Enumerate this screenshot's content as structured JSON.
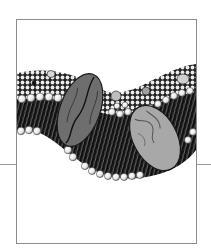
{
  "figure": {
    "style": "black-and-white engraving illustration",
    "frame": {
      "x": 16,
      "y": 19,
      "width": 181,
      "height": 225,
      "color": "#8c8c8c"
    },
    "rule": {
      "y": 164,
      "color": "#9a9a9a",
      "left": {
        "x1": 0,
        "x2": 16
      },
      "right": {
        "x1": 196,
        "x2": 211
      }
    },
    "colors": {
      "background": "#ffffff",
      "tails": "#111111",
      "head_fill": "#f4f4f4",
      "head_stroke": "#222222",
      "protein_left": "#6e6e6e",
      "protein_right": "#a8a8a8",
      "protein_outline": "#1a1a1a"
    },
    "proteins": [
      {
        "name": "left-protein",
        "cx": 80,
        "cy": 110,
        "rx": 20,
        "ry": 38,
        "rotate": 20
      },
      {
        "name": "right-protein",
        "cx": 155,
        "cy": 138,
        "rx": 22,
        "ry": 35,
        "rotate": -28
      }
    ]
  }
}
